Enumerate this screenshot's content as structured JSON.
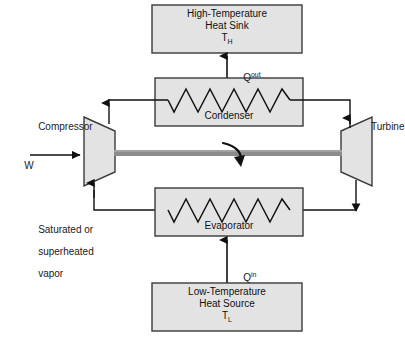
{
  "diagram": {
    "colors": {
      "box_fill": "#e3e3e3",
      "box_stroke": "#3a3a3a",
      "line": "#1a1a1a",
      "shaft": "#8c8c8c",
      "background": "#ffffff"
    },
    "components": {
      "heat_sink": {
        "line1": "High-Temperature",
        "line2": "Heat Sink",
        "symbol": "T",
        "symbol_sub": "H"
      },
      "condenser": {
        "label": "Condenser",
        "coil_peaks": 6
      },
      "compressor": {
        "label": "Compressor"
      },
      "turbine": {
        "label": "Turbine"
      },
      "evaporator": {
        "label": "Evaporator",
        "coil_peaks": 6
      },
      "heat_source": {
        "line1": "Low-Temperature",
        "line2": "Heat Source",
        "symbol": "T",
        "symbol_sub": "L"
      }
    },
    "flows": {
      "work_input": "W",
      "heat_out": "Q",
      "heat_out_sup": "out",
      "heat_in": "Q",
      "heat_in_sup": "in",
      "vapor_note_line1": "Saturated or",
      "vapor_note_line2": "superheated",
      "vapor_note_line3": "vapor"
    }
  }
}
